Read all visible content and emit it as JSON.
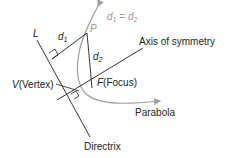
{
  "diagram": {
    "labels": {
      "directrix_letter": "L",
      "d1": "d",
      "d1_sub": "1",
      "d2": "d",
      "d2_sub": "2",
      "point": "P",
      "equation_d": "d",
      "equation_sub1": "1",
      "equation_eq": " = ",
      "equation_sub2": "2",
      "axis": "Axis of symmetry",
      "vertex_letter": "V",
      "vertex_text": "(Vertex)",
      "focus_letter": "F",
      "focus_text": "(Focus)",
      "parabola": "Parabola",
      "directrix": "Directrix"
    },
    "colors": {
      "line": "#231f20",
      "curve": "#a0a0a0"
    }
  }
}
